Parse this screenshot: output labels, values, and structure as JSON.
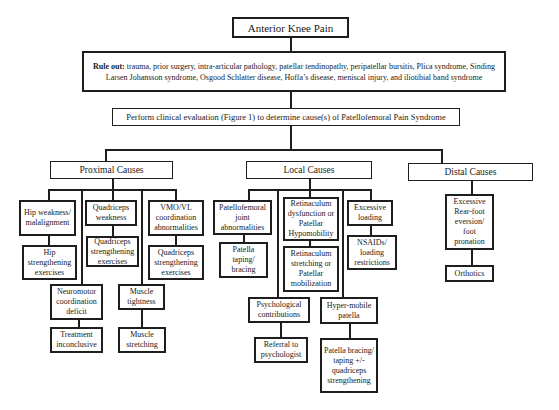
{
  "title": "Anterior Knee Pain",
  "rule_out": {
    "label": "Rule out:",
    "text": " trauma, prior surgery, intra-articular pathology, patellar tendinopathy, peripatellar bursitis, Plica syndrome, Sinding Larsen Johansson syndrome, Osgood Schlatter disease, Hoffa’s disease, meniscal injury, and iliotibial band syndrome"
  },
  "evaluation": "Perform clinical evaluation (Figure 1) to determine cause(s) of Patellofemoral Pain Syndrome",
  "categories": {
    "proximal": {
      "label": "Proximal Causes",
      "items": [
        {
          "cause": "Hip weakness/ malalignment",
          "treatment": "Hip strengthening exercises"
        },
        {
          "cause": "Quadriceps weakness",
          "treatment": "Quadriceps strengthening exercises"
        },
        {
          "cause": "VMO/VL coordination abnormalities",
          "treatment": "Quadriceps strengthening exercises"
        },
        {
          "cause": "Neuromotor coordination deficit",
          "treatment": "Treatment inconclusive"
        },
        {
          "cause": "Muscle tightness",
          "treatment": "Muscle stretching"
        }
      ]
    },
    "local": {
      "label": "Local Causes",
      "items": [
        {
          "cause": "Patellofemoral joint abnormalities",
          "treatment": "Patella taping/ bracing"
        },
        {
          "cause": "Retinaculum dysfunction or Patellar Hypomobility",
          "treatment": "Retinaculum stretching or Patellar mobilization"
        },
        {
          "cause": "Excessive loading",
          "treatment": "NSAIDs/ loading restrictions"
        },
        {
          "cause": "Psychological contributions",
          "treatment": "Referral to psychologist"
        },
        {
          "cause": "Hyper-mobile patella",
          "treatment": "Patella bracing/ taping +/- quadriceps strengthening"
        }
      ]
    },
    "distal": {
      "label": "Distal Causes",
      "items": [
        {
          "cause": "Excessive Rear-foot eversion/ foot pronation",
          "treatment": "Orthotics"
        }
      ]
    }
  }
}
